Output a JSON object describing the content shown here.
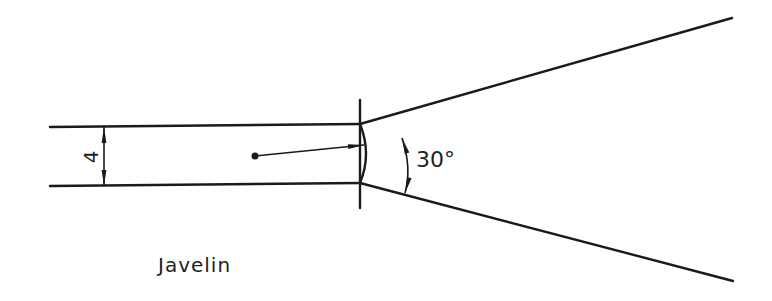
{
  "diagram": {
    "title_label": "Javelin",
    "width_dimension": "4",
    "angle_dimension": "30°",
    "colors": {
      "stroke": "#1a1a1a",
      "background": "#ffffff"
    },
    "elements": {
      "runway_top_line": {
        "x1": 50,
        "y1": 127,
        "x2": 360,
        "y2": 124
      },
      "runway_bottom_line": {
        "x1": 50,
        "y1": 186,
        "x2": 360,
        "y2": 183
      },
      "foul_line": {
        "x": 360,
        "y1": 100,
        "y2": 208
      },
      "sector_top_line": {
        "x1": 360,
        "y1": 124,
        "x2": 732,
        "y2": 18
      },
      "sector_bottom_line": {
        "x1": 360,
        "y1": 183,
        "x2": 733,
        "y2": 281
      },
      "throw_vector": {
        "x1": 255,
        "y1": 156,
        "x2": 363,
        "y2": 145
      }
    }
  }
}
